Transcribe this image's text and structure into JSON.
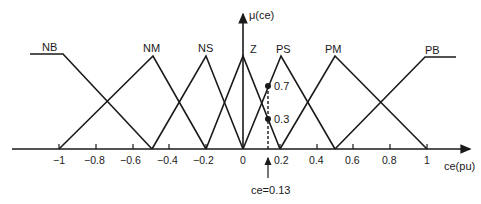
{
  "diagram": {
    "y_axis_label": "μ(ce)",
    "x_axis_label": "ce(pu)",
    "tick_labels": [
      "−1",
      "−0.8",
      "−0.6",
      "−0.4",
      "−0.2",
      "0",
      "0.2",
      "0.4",
      "0.6",
      "0.8",
      "1"
    ],
    "sets": [
      {
        "name": "NB",
        "shape": "trapezoid-left",
        "points": [
          -1.2,
          -1,
          -0.5
        ]
      },
      {
        "name": "NM",
        "shape": "triangle",
        "points": [
          -1,
          -0.5,
          -0.2
        ]
      },
      {
        "name": "NS",
        "shape": "triangle",
        "points": [
          -0.5,
          -0.2,
          0
        ]
      },
      {
        "name": "Z",
        "shape": "triangle",
        "points": [
          -0.2,
          0,
          0.2
        ]
      },
      {
        "name": "PS",
        "shape": "triangle",
        "points": [
          0,
          0.2,
          0.5
        ]
      },
      {
        "name": "PM",
        "shape": "triangle",
        "points": [
          0.2,
          0.5,
          1
        ]
      },
      {
        "name": "PB",
        "shape": "trapezoid-right",
        "points": [
          0.5,
          1,
          1.2
        ]
      }
    ],
    "marker_values": [
      "0.7",
      "0.3"
    ],
    "annotation": "ce=0.13",
    "line_color": "#1a1a1a"
  }
}
